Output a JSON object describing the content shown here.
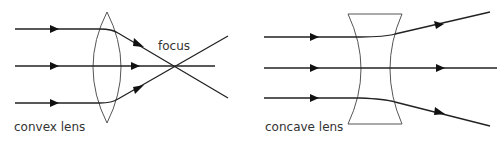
{
  "figure": {
    "type": "ray diagram",
    "panels": [
      {
        "id": "convex",
        "label": "convex lens",
        "annotation": "focus",
        "rays": 3,
        "behavior": "parallel rays converge to a focus point"
      },
      {
        "id": "concave",
        "label": "concave lens",
        "rays": 3,
        "behavior": "parallel rays diverge"
      }
    ]
  },
  "colors": {
    "ray": "#222222",
    "lens": "#555555",
    "text": "#333333",
    "background": "#ffffff"
  }
}
